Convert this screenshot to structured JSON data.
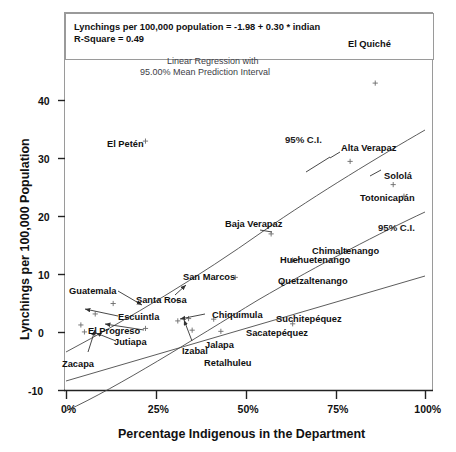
{
  "chart_data": {
    "type": "scatter",
    "title": "",
    "xlabel": "Percentage Indigenous in the Department",
    "ylabel": "Lynchings per 100,000 Population",
    "xlim": [
      0,
      100
    ],
    "ylim": [
      -10,
      45
    ],
    "xticks": [
      "0%",
      "25%",
      "50%",
      "75%",
      "100%"
    ],
    "xtick_values": [
      0,
      25,
      50,
      75,
      100
    ],
    "yticks": [
      "-10",
      "0",
      "10",
      "20",
      "30",
      "40"
    ],
    "ytick_values": [
      -10,
      0,
      10,
      20,
      30,
      40
    ],
    "grid": false,
    "legend": "none",
    "equation": "Lynchings per 100,000 population = -1.98 + 0.30 * indian",
    "r_square": "R-Square = 0.49",
    "annotation_line1": "Linear Regression with",
    "annotation_line2": "95.00% Mean Prediction Interval",
    "ci_label_upper": "95% C.I.",
    "ci_label_lower": "95% C.I.",
    "fit": {
      "intercept": -1.98,
      "slope": 0.3
    },
    "points": [
      {
        "name": "El Quiché",
        "x": 86,
        "y": 43.0
      },
      {
        "name": "El Petén",
        "x": 22,
        "y": 33.0
      },
      {
        "name": "Alta Verapaz",
        "x": 79,
        "y": 29.5
      },
      {
        "name": "Sololá",
        "x": 91,
        "y": 25.5
      },
      {
        "name": "Totonicapán",
        "x": 94,
        "y": 23.5
      },
      {
        "name": "Baja Verapaz",
        "x": 57,
        "y": 17.0
      },
      {
        "name": "Chimaltenango",
        "x": 78,
        "y": 14.0
      },
      {
        "name": "Huehuetenango",
        "x": 63,
        "y": 12.5
      },
      {
        "name": "San Marcos",
        "x": 47,
        "y": 9.5
      },
      {
        "name": "Quetzaltenango",
        "x": 60,
        "y": 8.5
      },
      {
        "name": "Guatemala",
        "x": 13,
        "y": 5.0
      },
      {
        "name": "Santa Rosa",
        "x": 31,
        "y": 5.5
      },
      {
        "name": "Escuintla",
        "x": 8,
        "y": 3.2
      },
      {
        "name": "Chiquimula",
        "x": 34,
        "y": 2.4
      },
      {
        "name": "Suchitepéquez",
        "x": 41,
        "y": 2.3
      },
      {
        "name": "Sacatepéquez",
        "x": 63,
        "y": 1.5
      },
      {
        "name": "El Progreso",
        "x": 4,
        "y": 1.3
      },
      {
        "name": "Izabal",
        "x": 31,
        "y": 2.0
      },
      {
        "name": "Jutiapa",
        "x": 22,
        "y": 0.7
      },
      {
        "name": "Jalapa",
        "x": 35,
        "y": 0.4
      },
      {
        "name": "Retalhuleu",
        "x": 43,
        "y": 0.2
      },
      {
        "name": "Zacapa",
        "x": 5,
        "y": 0.1
      }
    ],
    "labels": [
      {
        "text": "El Quiché",
        "px": 348,
        "py": 40
      },
      {
        "text": "El Petén",
        "px": 107,
        "py": 140
      },
      {
        "text": "Alta Verapaz",
        "px": 341,
        "py": 144
      },
      {
        "text": "Sololá",
        "px": 384,
        "py": 172
      },
      {
        "text": "Totonicapán",
        "px": 360,
        "py": 194
      },
      {
        "text": "Baja Verapaz",
        "px": 225,
        "py": 220
      },
      {
        "text": "Chimaltenango",
        "px": 312,
        "py": 247
      },
      {
        "text": "Huehuetenango",
        "px": 280,
        "py": 256
      },
      {
        "text": "Quetzaltenango",
        "px": 278,
        "py": 277
      },
      {
        "text": "San Marcos",
        "px": 183,
        "py": 273
      },
      {
        "text": "Guatemala",
        "px": 69,
        "py": 287
      },
      {
        "text": "Santa Rosa",
        "px": 136,
        "py": 296
      },
      {
        "text": "Escuintla",
        "px": 118,
        "py": 313
      },
      {
        "text": "Chiquimula",
        "px": 212,
        "py": 311
      },
      {
        "text": "Suchitepéquez",
        "px": 276,
        "py": 315
      },
      {
        "text": "Sacatepéquez",
        "px": 246,
        "py": 329
      },
      {
        "text": "El Progreso",
        "px": 88,
        "py": 327
      },
      {
        "text": "Jutiapa",
        "px": 114,
        "py": 338
      },
      {
        "text": "Izabal",
        "px": 182,
        "py": 347
      },
      {
        "text": "Jalapa",
        "px": 205,
        "py": 341
      },
      {
        "text": "Retalhuleu",
        "px": 204,
        "py": 359
      },
      {
        "text": "Zacapa",
        "px": 62,
        "py": 360
      }
    ]
  }
}
